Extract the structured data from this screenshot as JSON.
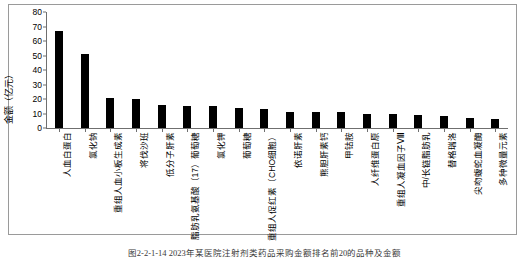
{
  "chart_data": {
    "type": "bar",
    "title": "",
    "xlabel": "",
    "ylabel": "金额（亿元）",
    "ylim": [
      0,
      80
    ],
    "yticks": [
      0,
      10,
      20,
      30,
      40,
      50,
      60,
      70,
      80
    ],
    "grid": false,
    "legend": "none",
    "categories": [
      "人血白蛋白",
      "氯化钠",
      "重组人血小板生成素",
      "将伐沙班",
      "低分子肝素",
      "脂肪乳氨基酸（17）葡萄糖",
      "氯化钾",
      "葡萄糖",
      "重组人促红素（CHO细胞）",
      "依诺肝素",
      "熊胆肝素钙",
      "甲钴胺",
      "人纤维蛋白原",
      "重组人凝血因子Ⅷ",
      "中/长链脂肪乳",
      "替格瑞洛",
      "尖吻蝮蛇血凝酶",
      "多种微量元素"
    ],
    "values": [
      67,
      51,
      21,
      20,
      16,
      15,
      15,
      14,
      13,
      11,
      11,
      11,
      10,
      10,
      9,
      8,
      7,
      6
    ]
  },
  "caption": {
    "text": "图2-2-1-14   2023年某医院注射剂类药品采购金额排名前20的品种及金额"
  }
}
